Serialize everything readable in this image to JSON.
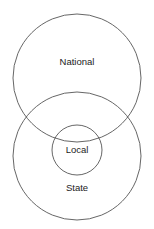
{
  "diagram": {
    "type": "nested-venn",
    "stroke_color": "#555555",
    "background": "#ffffff",
    "sets": [
      {
        "id": "national",
        "label": "National",
        "cx": 77,
        "cy": 78,
        "r": 64,
        "label_x": 77,
        "label_y": 65
      },
      {
        "id": "state",
        "label": "State",
        "cx": 77,
        "cy": 156,
        "r": 64,
        "label_x": 77,
        "label_y": 191
      },
      {
        "id": "local",
        "label": "Local",
        "cx": 77,
        "cy": 150,
        "r": 25,
        "label_x": 77,
        "label_y": 153
      }
    ]
  }
}
